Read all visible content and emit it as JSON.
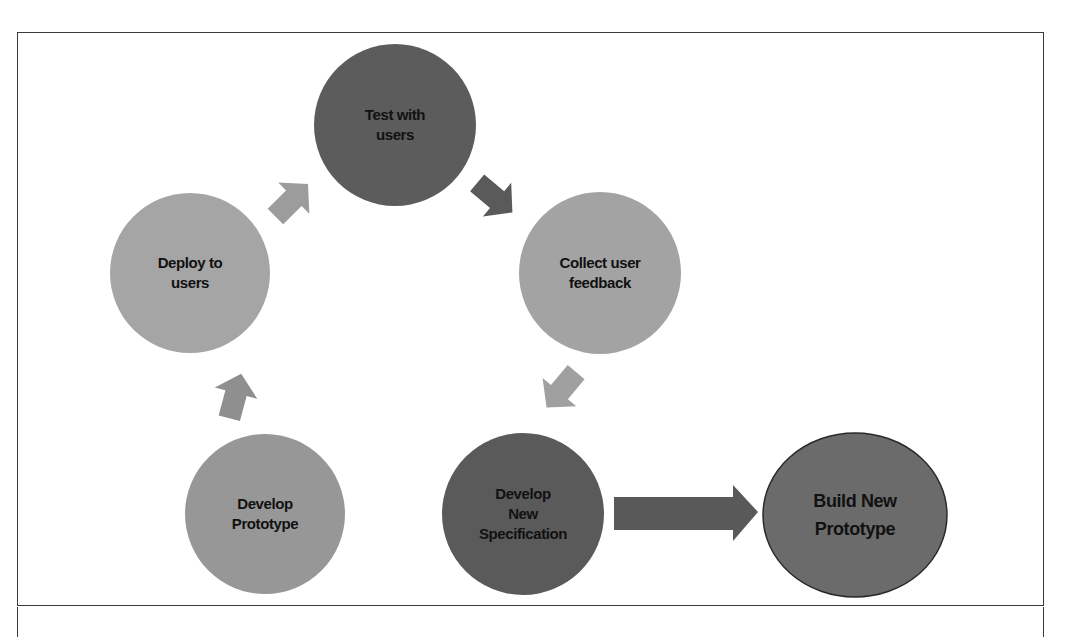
{
  "diagram": {
    "type": "iterative-prototyping-cycle",
    "nodes": [
      {
        "id": "test",
        "label": "Test with\nusers",
        "fill": "#5c5c5c",
        "shape": "circle",
        "cx": 395,
        "cy": 125,
        "rx": 80,
        "ry": 83
      },
      {
        "id": "collect",
        "label": "Collect user\nfeedback",
        "fill": "#a3a3a3",
        "shape": "circle",
        "cx": 600,
        "cy": 273,
        "rx": 80,
        "ry": 82
      },
      {
        "id": "spec",
        "label": "Develop\nNew\nSpecification",
        "fill": "#5a5a5a",
        "shape": "circle",
        "cx": 523,
        "cy": 514,
        "rx": 80,
        "ry": 83
      },
      {
        "id": "prototype",
        "label": "Develop\nPrototype",
        "fill": "#979797",
        "shape": "circle",
        "cx": 265,
        "cy": 514,
        "rx": 78,
        "ry": 83
      },
      {
        "id": "deploy",
        "label": "Deploy to\nusers",
        "fill": "#a5a5a5",
        "shape": "circle",
        "cx": 190,
        "cy": 273,
        "rx": 78,
        "ry": 82
      },
      {
        "id": "build",
        "label": "Build New\nPrototype",
        "fill": "#6b6b6b",
        "stroke": "#2a2a2a",
        "shape": "ellipse",
        "cx": 855,
        "cy": 515,
        "rx": 93,
        "ry": 83
      }
    ],
    "edges": [
      {
        "from": "deploy",
        "to": "test",
        "fill": "#9c9c9c"
      },
      {
        "from": "test",
        "to": "collect",
        "fill": "#5a5a5a"
      },
      {
        "from": "collect",
        "to": "spec",
        "fill": "#a0a0a0"
      },
      {
        "from": "prototype",
        "to": "deploy",
        "fill": "#8f8f8f"
      },
      {
        "from": "spec",
        "to": "build",
        "fill": "#595959",
        "style": "large-block-arrow"
      }
    ]
  }
}
